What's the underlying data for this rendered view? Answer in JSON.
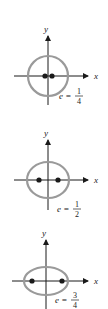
{
  "diagrams": [
    {
      "id": "circle",
      "axis_x_label": "x",
      "axis_y_label": "y",
      "eccentricity_label": "e =",
      "eccentricity_num": "1",
      "eccentricity_den": "4",
      "center": [
        48,
        76
      ],
      "rx": 20,
      "ry": 20,
      "foci_x": [
        45,
        52
      ]
    },
    {
      "id": "ellipse-half",
      "axis_x_label": "x",
      "axis_y_label": "y",
      "eccentricity_label": "e =",
      "eccentricity_num": "1",
      "eccentricity_den": "2",
      "center": [
        48,
        180
      ],
      "rx": 21,
      "ry": 18,
      "foci_x": [
        39,
        58
      ]
    },
    {
      "id": "ellipse-three-quarter",
      "axis_x_label": "x",
      "axis_y_label": "y",
      "eccentricity_label": "e =",
      "eccentricity_num": "3",
      "eccentricity_den": "4",
      "center": [
        46,
        281
      ],
      "rx": 22,
      "ry": 14,
      "foci_x": [
        32,
        62
      ]
    }
  ]
}
